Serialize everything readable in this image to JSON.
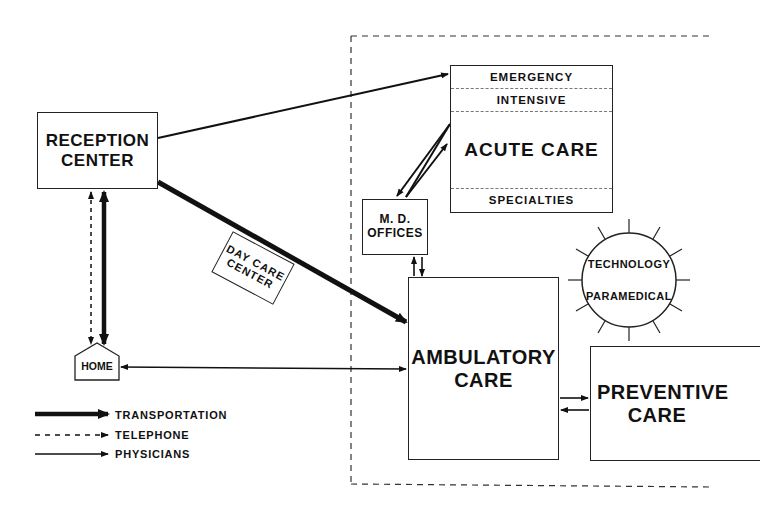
{
  "diagram": {
    "nodes": {
      "reception_center": {
        "line1": "RECEPTION",
        "line2": "CENTER"
      },
      "acute_care": {
        "sections": [
          "EMERGENCY",
          "INTENSIVE",
          "ACUTE CARE",
          "SPECIALTIES"
        ]
      },
      "md_offices": {
        "line1": "M. D.",
        "line2": "OFFICES"
      },
      "day_care_center": {
        "line1": "DAY CARE",
        "line2": "CENTER"
      },
      "technology_paramedical": {
        "line1": "TECHNOLOGY",
        "line2": "PARAMEDICAL"
      },
      "ambulatory_care": {
        "line1": "AMBULATORY",
        "line2": "CARE"
      },
      "preventive_care": {
        "line1": "PREVENTIVE",
        "line2": "CARE"
      },
      "home": {
        "label": "HOME"
      }
    },
    "legend": [
      {
        "style": "thick-solid",
        "label": "TRANSPORTATION"
      },
      {
        "style": "dashed",
        "label": "TELEPHONE"
      },
      {
        "style": "thin-solid",
        "label": "PHYSICIANS"
      }
    ],
    "edges": [
      {
        "from": "RECEPTION CENTER",
        "to": "EMERGENCY",
        "type": "physicians"
      },
      {
        "from": "RECEPTION CENTER",
        "to": "AMBULATORY CARE",
        "type": "transportation",
        "via": "DAY CARE CENTER"
      },
      {
        "from": "RECEPTION CENTER",
        "to": "HOME",
        "type": "transportation",
        "bidirectional": true
      },
      {
        "from": "RECEPTION CENTER",
        "to": "HOME",
        "type": "telephone",
        "bidirectional": true
      },
      {
        "from": "HOME",
        "to": "AMBULATORY CARE",
        "type": "physicians",
        "bidirectional": true
      },
      {
        "from": "M. D. OFFICES",
        "to": "ACUTE CARE",
        "type": "physicians",
        "bidirectional": true
      },
      {
        "from": "M. D. OFFICES",
        "to": "AMBULATORY CARE",
        "type": "physicians",
        "bidirectional": true
      },
      {
        "from": "AMBULATORY CARE",
        "to": "PREVENTIVE CARE",
        "type": "physicians",
        "bidirectional": true
      }
    ]
  }
}
